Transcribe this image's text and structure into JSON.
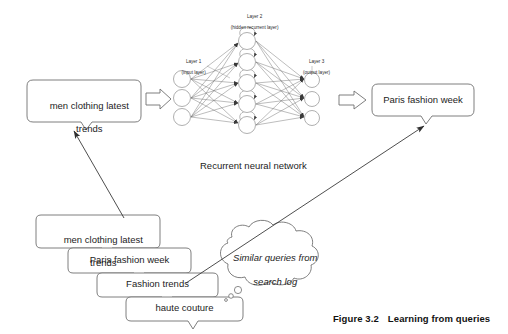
{
  "figure": {
    "number": "Figure 3.2",
    "title": "Learning from queries"
  },
  "network": {
    "caption": "Recurrent neural network",
    "layers": [
      {
        "id": "layer-1",
        "name": "Layer 1",
        "sublabel": "(input layer)",
        "nodes": 3
      },
      {
        "id": "layer-2",
        "name": "Layer 2",
        "sublabel": "(hidden recurrent layer)",
        "nodes": 5
      },
      {
        "id": "layer-3",
        "name": "Layer 3",
        "sublabel": "(output layer)",
        "nodes": 3
      }
    ]
  },
  "input_callout": {
    "line1": "men clothing latest",
    "line2": "trends"
  },
  "output_callout": {
    "line1": "Paris fashion week"
  },
  "query_stack": [
    {
      "line1": "men clothing latest",
      "line2": "trends"
    },
    {
      "line1": "Paris fashion week",
      "line2": ""
    },
    {
      "line1": "Fashion trends",
      "line2": ""
    },
    {
      "line1": "haute couture",
      "line2": ""
    }
  ],
  "thought_cloud": {
    "line1": "Similar queries from",
    "line2": "search log"
  },
  "colors": {
    "stroke": "#555555",
    "node_stroke": "#8a8a8a",
    "edge": "#6b6b6b",
    "text": "#1d1d1d",
    "fill": "#ffffff",
    "arrow": "#3a3a3a"
  }
}
